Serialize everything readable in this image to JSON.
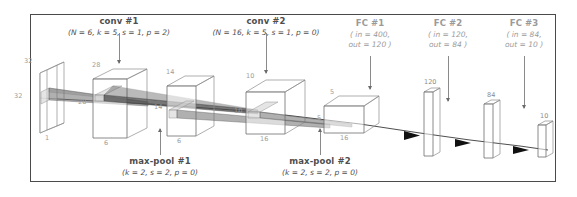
{
  "figure": {
    "type": "diagram"
  },
  "top_labels": [
    {
      "name": "conv1",
      "title": "conv #1",
      "params": "(N = 6, k = 5, s = 1, p = 2)",
      "faint": false
    },
    {
      "name": "conv2",
      "title": "conv #2",
      "params": "(N = 16, k = 5, s = 1, p = 0)",
      "faint": false
    },
    {
      "name": "fc1",
      "title": "FC #1",
      "params": "( in = 400,\nout = 120 )",
      "faint": true
    },
    {
      "name": "fc2",
      "title": "FC #2",
      "params": "( in = 120,\nout = 84 )",
      "faint": true
    },
    {
      "name": "fc3",
      "title": "FC #3",
      "params": "( in = 84,\nout = 10 )",
      "faint": true
    }
  ],
  "top_labels_text": {
    "conv1_title": "conv #1",
    "conv1_params": "(N = 6, k = 5, s = 1, p = 2)",
    "conv2_title": "conv #2",
    "conv2_params": "(N = 16, k = 5, s = 1, p = 0)",
    "fc1_title": "FC #1",
    "fc1_in": "( in = 400,",
    "fc1_out": "out = 120 )",
    "fc2_title": "FC #2",
    "fc2_in": "( in = 120,",
    "fc2_out": "out = 84 )",
    "fc3_title": "FC #3",
    "fc3_in": "( in = 84,",
    "fc3_out": "out = 10 )"
  },
  "bottom_labels_text": {
    "pool1_title": "max-pool #1",
    "pool1_params": "(k = 2, s = 2, p = 0)",
    "pool2_title": "max-pool #2",
    "pool2_params": "(k = 2, s = 2, p = 0)"
  },
  "volumes": [
    {
      "name": "input",
      "top": "32",
      "side": "32",
      "depth": "1"
    },
    {
      "name": "conv1-out",
      "top": "28",
      "side": "28",
      "depth": "6"
    },
    {
      "name": "pool1-out",
      "top": "14",
      "side": "14",
      "depth": "6"
    },
    {
      "name": "conv2-out",
      "top": "10",
      "side": "10",
      "depth": "16"
    },
    {
      "name": "pool2-out",
      "top": "5",
      "side": "5",
      "depth": "16"
    }
  ],
  "volume_dims": {
    "v1_top": "32",
    "v1_side": "32",
    "v1_depth": "1",
    "v2_top": "28",
    "v2_side": "28",
    "v2_depth": "6",
    "v3_top": "14",
    "v3_side": "14",
    "v3_depth": "6",
    "v4_top": "10",
    "v4_side": "10",
    "v4_depth": "16",
    "v5_top": "5",
    "v5_side": "5",
    "v5_depth": "16"
  },
  "fc_bars": {
    "fc1_units": "120",
    "fc2_units": "84",
    "fc3_units": "10"
  },
  "colors": {
    "frame": "#4a4a4a",
    "text": "#4e4e4e",
    "faint_text": "#9a9a9a",
    "dim_text": "#9b9b9b",
    "box_edge": "#8d8d8d",
    "arrow": "#111111",
    "background": "#ffffff"
  }
}
